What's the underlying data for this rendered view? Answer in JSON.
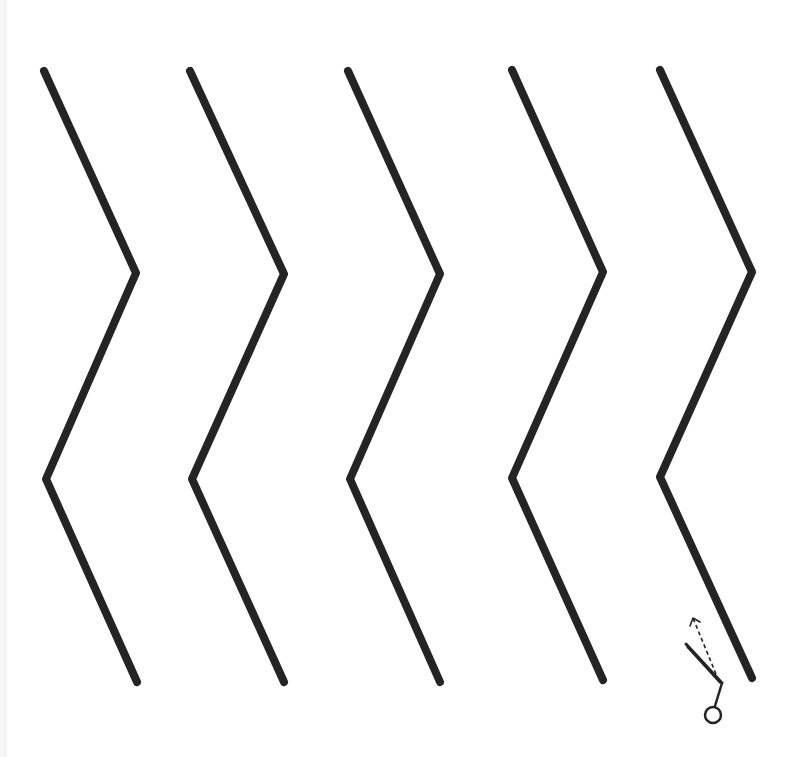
{
  "worksheet": {
    "title": "Zigzag cutting practice",
    "line_color": "#242424",
    "background_color": "#ffffff",
    "zigzag_lines": [
      {
        "id": 1,
        "points": [
          [
            44,
            71
          ],
          [
            136,
            273
          ],
          [
            46,
            479
          ],
          [
            137,
            682
          ]
        ]
      },
      {
        "id": 2,
        "points": [
          [
            190,
            71
          ],
          [
            284,
            274
          ],
          [
            192,
            479
          ],
          [
            284,
            682
          ]
        ]
      },
      {
        "id": 3,
        "points": [
          [
            348,
            71
          ],
          [
            440,
            274
          ],
          [
            350,
            479
          ],
          [
            440,
            682
          ]
        ]
      },
      {
        "id": 4,
        "points": [
          [
            512,
            70
          ],
          [
            603,
            272
          ],
          [
            512,
            478
          ],
          [
            603,
            680
          ]
        ]
      },
      {
        "id": 5,
        "points": [
          [
            660,
            70
          ],
          [
            752,
            272
          ],
          [
            660,
            477
          ],
          [
            752,
            678
          ]
        ]
      }
    ],
    "scissors": {
      "icon": "scissors-icon",
      "blade_start": [
        686,
        644
      ],
      "blade_end": [
        722,
        683
      ],
      "handle_end": [
        715,
        706
      ],
      "ring_center": [
        713,
        715
      ],
      "ring_radius": 8
    },
    "cut_direction_arrow": {
      "icon": "arrow-up-dashed-icon",
      "start": [
        716,
        674
      ],
      "end": [
        693,
        618
      ]
    }
  }
}
